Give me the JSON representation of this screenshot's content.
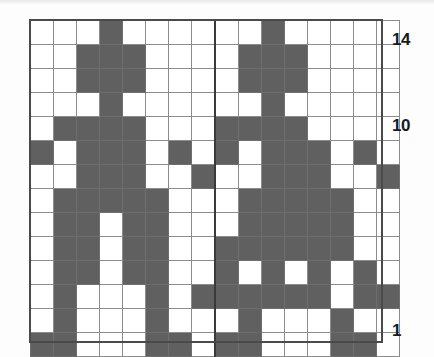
{
  "figure": {
    "kind": "pixel-grid-diagram",
    "columns": 16,
    "rows": 14,
    "filled_color": "#606060",
    "empty_color": "#ffffff",
    "gridline_color": "#8c8c8c",
    "frame_color": "#4a4a4a",
    "mid_rule_after_column": 8
  },
  "axis_labels": [
    {
      "text": "14",
      "row": 14
    },
    {
      "text": "10",
      "row": 10
    },
    {
      "text": "1",
      "row": 1
    }
  ],
  "chart_data": {
    "type": "heatmap",
    "title": "",
    "xlabel": "",
    "ylabel": "",
    "x": [
      1,
      2,
      3,
      4,
      5,
      6,
      7,
      8,
      9,
      10,
      11,
      12,
      13,
      14,
      15,
      16
    ],
    "y": [
      1,
      2,
      3,
      4,
      5,
      6,
      7,
      8,
      9,
      10,
      11,
      12,
      13,
      14
    ],
    "xlim": [
      1,
      16
    ],
    "ylim": [
      1,
      14
    ],
    "grid": true,
    "legend": null,
    "tick_labels": {
      "y": [
        "1",
        "10",
        "14"
      ],
      "x": []
    },
    "value_meaning": {
      "1": "filled",
      "0": "empty"
    },
    "rows_top_to_bottom": [
      {
        "row": 14,
        "cells": [
          0,
          0,
          0,
          1,
          0,
          0,
          0,
          0,
          0,
          0,
          1,
          0,
          0,
          0,
          0,
          0
        ]
      },
      {
        "row": 13,
        "cells": [
          0,
          0,
          1,
          1,
          1,
          0,
          0,
          0,
          0,
          1,
          1,
          1,
          0,
          0,
          0,
          0
        ]
      },
      {
        "row": 12,
        "cells": [
          0,
          0,
          1,
          1,
          1,
          0,
          0,
          0,
          0,
          1,
          1,
          1,
          0,
          0,
          0,
          0
        ]
      },
      {
        "row": 11,
        "cells": [
          0,
          0,
          0,
          1,
          0,
          0,
          0,
          0,
          0,
          0,
          1,
          0,
          0,
          0,
          0,
          0
        ]
      },
      {
        "row": 10,
        "cells": [
          0,
          1,
          1,
          1,
          1,
          0,
          0,
          0,
          1,
          1,
          1,
          1,
          0,
          0,
          0,
          0
        ]
      },
      {
        "row": 9,
        "cells": [
          1,
          0,
          1,
          1,
          1,
          0,
          1,
          0,
          1,
          0,
          1,
          1,
          1,
          0,
          1,
          0
        ]
      },
      {
        "row": 8,
        "cells": [
          0,
          0,
          1,
          1,
          1,
          0,
          0,
          1,
          0,
          0,
          1,
          1,
          1,
          0,
          0,
          1
        ]
      },
      {
        "row": 7,
        "cells": [
          0,
          1,
          1,
          1,
          1,
          1,
          0,
          0,
          0,
          1,
          1,
          1,
          1,
          1,
          0,
          0
        ]
      },
      {
        "row": 6,
        "cells": [
          0,
          1,
          1,
          0,
          1,
          1,
          0,
          0,
          0,
          1,
          1,
          1,
          1,
          1,
          0,
          0
        ]
      },
      {
        "row": 5,
        "cells": [
          0,
          1,
          1,
          0,
          1,
          1,
          0,
          0,
          1,
          1,
          1,
          1,
          1,
          1,
          0,
          0
        ]
      },
      {
        "row": 4,
        "cells": [
          0,
          1,
          1,
          0,
          1,
          1,
          0,
          0,
          1,
          0,
          1,
          0,
          1,
          0,
          1,
          0
        ]
      },
      {
        "row": 3,
        "cells": [
          0,
          1,
          0,
          0,
          0,
          1,
          0,
          1,
          1,
          1,
          1,
          1,
          1,
          0,
          1,
          1
        ]
      },
      {
        "row": 2,
        "cells": [
          0,
          1,
          0,
          0,
          0,
          1,
          0,
          0,
          0,
          1,
          0,
          0,
          0,
          1,
          0,
          0
        ]
      },
      {
        "row": 1,
        "cells": [
          1,
          1,
          0,
          0,
          0,
          1,
          1,
          0,
          1,
          1,
          0,
          0,
          0,
          1,
          1,
          0
        ]
      }
    ]
  }
}
